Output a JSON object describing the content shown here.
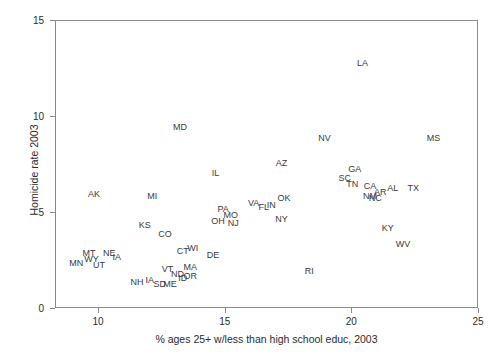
{
  "chart_data": {
    "type": "scatter",
    "title": "",
    "xlabel": "% ages 25+ w/less than high school educ, 2003",
    "ylabel": "Homicide rate 2003",
    "xlim": [
      8.3,
      25.0
    ],
    "ylim": [
      0,
      15
    ],
    "xticks": [
      "10",
      "15",
      "20",
      "25"
    ],
    "xtick_values": [
      10,
      15,
      20,
      25
    ],
    "yticks": [
      "0",
      "5",
      "10",
      "15"
    ],
    "ytick_values": [
      0,
      5,
      10,
      15
    ],
    "grid": false,
    "legend": "none",
    "point_marker": "text-label",
    "points": [
      {
        "label": "AK",
        "x": 9.8,
        "y": 6.0
      },
      {
        "label": "MT",
        "x": 9.6,
        "y": 2.9
      },
      {
        "label": "MN",
        "x": 9.1,
        "y": 2.4
      },
      {
        "label": "WY",
        "x": 9.7,
        "y": 2.6
      },
      {
        "label": "UT",
        "x": 10.0,
        "y": 2.3
      },
      {
        "label": "NE",
        "x": 10.4,
        "y": 2.9
      },
      {
        "label": "IA",
        "x": 10.7,
        "y": 2.7
      },
      {
        "label": "NH",
        "x": 11.5,
        "y": 1.4
      },
      {
        "label": "IA",
        "x": 12.0,
        "y": 1.5
      },
      {
        "label": "SD",
        "x": 12.4,
        "y": 1.3
      },
      {
        "label": "ME",
        "x": 12.8,
        "y": 1.3
      },
      {
        "label": "VT",
        "x": 12.7,
        "y": 2.1
      },
      {
        "label": "ND",
        "x": 13.1,
        "y": 1.8
      },
      {
        "label": "ID",
        "x": 13.3,
        "y": 1.6
      },
      {
        "label": "OR",
        "x": 13.6,
        "y": 1.7
      },
      {
        "label": "MA",
        "x": 13.6,
        "y": 2.2
      },
      {
        "label": "KS",
        "x": 11.8,
        "y": 4.4
      },
      {
        "label": "CO",
        "x": 12.6,
        "y": 3.9
      },
      {
        "label": "CT",
        "x": 13.3,
        "y": 3.0
      },
      {
        "label": "WI",
        "x": 13.7,
        "y": 3.2
      },
      {
        "label": "MI",
        "x": 12.1,
        "y": 5.9
      },
      {
        "label": "DE",
        "x": 14.5,
        "y": 2.8
      },
      {
        "label": "MD",
        "x": 13.2,
        "y": 9.5
      },
      {
        "label": "IL",
        "x": 14.6,
        "y": 7.1
      },
      {
        "label": "PA",
        "x": 14.9,
        "y": 5.2
      },
      {
        "label": "OH",
        "x": 14.7,
        "y": 4.6
      },
      {
        "label": "MO",
        "x": 15.2,
        "y": 4.9
      },
      {
        "label": "NJ",
        "x": 15.3,
        "y": 4.5
      },
      {
        "label": "VA",
        "x": 16.1,
        "y": 5.5
      },
      {
        "label": "FL",
        "x": 16.5,
        "y": 5.3
      },
      {
        "label": "IN",
        "x": 16.8,
        "y": 5.4
      },
      {
        "label": "OK",
        "x": 17.3,
        "y": 5.8
      },
      {
        "label": "NY",
        "x": 17.2,
        "y": 4.7
      },
      {
        "label": "AZ",
        "x": 17.2,
        "y": 7.6
      },
      {
        "label": "NV",
        "x": 18.9,
        "y": 8.9
      },
      {
        "label": "SC",
        "x": 19.7,
        "y": 6.8
      },
      {
        "label": "GA",
        "x": 20.1,
        "y": 7.3
      },
      {
        "label": "TN",
        "x": 20.0,
        "y": 6.5
      },
      {
        "label": "CA",
        "x": 20.7,
        "y": 6.4
      },
      {
        "label": "NM",
        "x": 20.7,
        "y": 5.9
      },
      {
        "label": "NC",
        "x": 20.9,
        "y": 5.8
      },
      {
        "label": "AR",
        "x": 21.1,
        "y": 6.1
      },
      {
        "label": "AL",
        "x": 21.6,
        "y": 6.3
      },
      {
        "label": "TX",
        "x": 22.4,
        "y": 6.3
      },
      {
        "label": "KY",
        "x": 21.4,
        "y": 4.2
      },
      {
        "label": "WV",
        "x": 22.0,
        "y": 3.4
      },
      {
        "label": "RI",
        "x": 18.3,
        "y": 2.0
      },
      {
        "label": "LA",
        "x": 20.4,
        "y": 12.8
      },
      {
        "label": "MS",
        "x": 23.2,
        "y": 8.9
      }
    ]
  }
}
